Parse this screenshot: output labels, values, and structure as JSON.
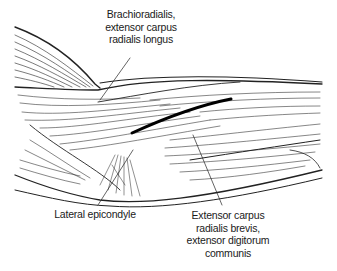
{
  "figure": {
    "labels": {
      "top": {
        "lines": [
          "Brachioradialis,",
          "extensor carpus",
          "radialis longus"
        ]
      },
      "bottom_left": {
        "lines": [
          "Lateral epicondyle"
        ]
      },
      "bottom_right": {
        "lines": [
          "Extensor carpus",
          "radialis brevis,",
          "extensor digitorum",
          "communis"
        ]
      }
    },
    "colors": {
      "ink": "#1a1a1a",
      "background": "#ffffff"
    }
  }
}
